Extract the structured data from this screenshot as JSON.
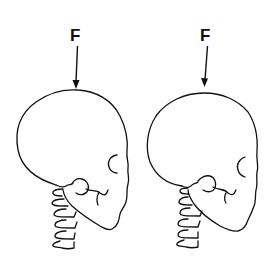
{
  "figure": {
    "panels": [
      {
        "id": "left",
        "force_label": "F",
        "description": "Skull in profile with cervical spine, force arrow applied vertically at the crown"
      },
      {
        "id": "right",
        "force_label": "F",
        "description": "Skull in profile with cervical spine, force arrow applied slightly anterior/angled at the crown"
      }
    ],
    "colors": {
      "line": "#111111",
      "background": "#ffffff"
    }
  }
}
